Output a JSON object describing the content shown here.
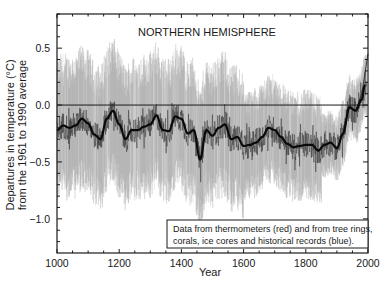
{
  "chart_data": {
    "type": "line",
    "title": "NORTHERN HEMISPHERE",
    "xlabel": "Year",
    "ylabel": "Departures in temperature (°C) from the 1961 to 1990 average",
    "ylabel_lines": [
      "Departures in temperature (°C)",
      "from the 1961 to 1990 average"
    ],
    "xlim": [
      1000,
      2000
    ],
    "ylim": [
      -1.3,
      0.8
    ],
    "x_ticks": [
      1000,
      1200,
      1400,
      1600,
      1800,
      2000
    ],
    "x_tick_labels": [
      "1000",
      "1200",
      "1400",
      "1600",
      "1800",
      "2000"
    ],
    "y_ticks": [
      0.5,
      0.0,
      -0.5,
      -1.0
    ],
    "y_tick_labels": [
      "0.5",
      "0.0",
      "−0.5",
      "−1.0"
    ],
    "grid": false,
    "reference_line": 0.0,
    "legend": {
      "position": "lower right",
      "lines": [
        "Data from thermometers (red) and from tree rings,",
        "corals, ice cores and historical records (blue)."
      ]
    },
    "series": [
      {
        "name": "Smoothed reconstruction (50-year)",
        "style": "thick black line",
        "x": [
          1000,
          1020,
          1040,
          1060,
          1080,
          1100,
          1120,
          1140,
          1160,
          1180,
          1200,
          1220,
          1240,
          1260,
          1280,
          1300,
          1320,
          1340,
          1360,
          1380,
          1400,
          1420,
          1440,
          1460,
          1480,
          1500,
          1520,
          1540,
          1560,
          1580,
          1600,
          1620,
          1640,
          1660,
          1680,
          1700,
          1720,
          1740,
          1760,
          1780,
          1800,
          1820,
          1840,
          1860,
          1880,
          1900,
          1920,
          1940,
          1960,
          1980,
          1990
        ],
        "values": [
          -0.22,
          -0.18,
          -0.2,
          -0.18,
          -0.12,
          -0.16,
          -0.26,
          -0.3,
          -0.12,
          -0.05,
          -0.17,
          -0.3,
          -0.22,
          -0.22,
          -0.19,
          -0.17,
          -0.09,
          -0.22,
          -0.23,
          -0.1,
          -0.12,
          -0.25,
          -0.22,
          -0.48,
          -0.22,
          -0.27,
          -0.2,
          -0.17,
          -0.3,
          -0.28,
          -0.36,
          -0.35,
          -0.33,
          -0.28,
          -0.2,
          -0.22,
          -0.28,
          -0.34,
          -0.37,
          -0.36,
          -0.35,
          -0.35,
          -0.4,
          -0.35,
          -0.33,
          -0.38,
          -0.25,
          -0.02,
          -0.05,
          0.05,
          0.18
        ]
      },
      {
        "name": "Annual reconstruction",
        "style": "thin dark grey line",
        "noise_amplitude": 0.12
      },
      {
        "name": "Uncertainty range",
        "style": "light grey band",
        "color": "#a8a8a8",
        "band_halfwidth_approx": 0.5
      },
      {
        "name": "Instrumental (thermometer) record",
        "style": "thin line",
        "x": [
          1900,
          1920,
          1940,
          1960,
          1980,
          2000
        ],
        "values": [
          -0.3,
          -0.25,
          0.0,
          -0.05,
          0.1,
          0.45
        ]
      }
    ]
  },
  "colors": {
    "band": "#a8a8a8",
    "band_light": "#d4d4d4",
    "annual": "#3a3a3a",
    "smoothed": "#0a0a0a",
    "axis": "#1a1a1a"
  }
}
